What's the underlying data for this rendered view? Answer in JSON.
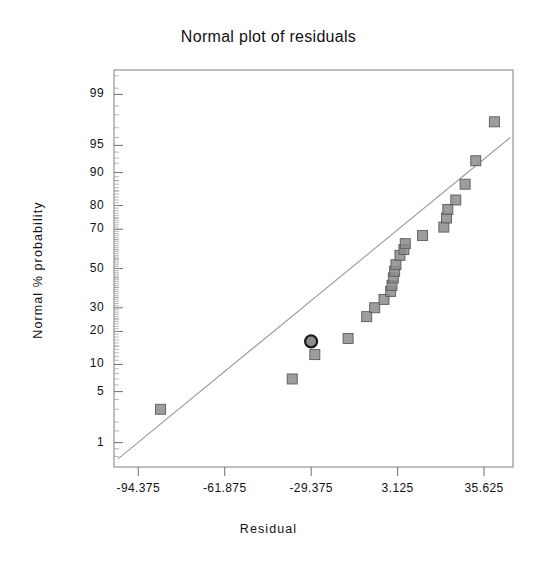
{
  "chart_data": {
    "type": "scatter",
    "title": "Normal plot of residuals",
    "xlabel": "Residual",
    "ylabel": "Normal % probability",
    "grid": false,
    "legend": "none",
    "x_tick_labels": [
      "-94.375",
      "-61.875",
      "-29.375",
      "3.125",
      "35.625"
    ],
    "x_tick_values": [
      -94.375,
      -61.875,
      -29.375,
      3.125,
      35.625
    ],
    "xlim": [
      -103.5,
      46.5
    ],
    "y_tick_labels": [
      "99",
      "95",
      "90",
      "80",
      "70",
      "50",
      "30",
      "20",
      "10",
      "5",
      "1"
    ],
    "y_tick_values": [
      99,
      95,
      90,
      80,
      70,
      50,
      30,
      20,
      10,
      5,
      1
    ],
    "ylim": [
      0.4,
      99.6
    ],
    "y_scale": "normal-probability",
    "reference_line": {
      "x_start": -102.0,
      "y_start": 0.55,
      "x_end": 45.5,
      "y_end": 96.0
    },
    "points": [
      {
        "x": -86.0,
        "y": 3.0,
        "marker": "square",
        "highlighted": false
      },
      {
        "x": -36.5,
        "y": 7.0,
        "marker": "square",
        "highlighted": false
      },
      {
        "x": -29.4,
        "y": 16.5,
        "marker": "circle",
        "highlighted": true
      },
      {
        "x": -28.0,
        "y": 12.5,
        "marker": "square",
        "highlighted": false
      },
      {
        "x": -15.5,
        "y": 17.5,
        "marker": "square",
        "highlighted": false
      },
      {
        "x": -8.5,
        "y": 26.0,
        "marker": "square",
        "highlighted": false
      },
      {
        "x": -5.5,
        "y": 30.0,
        "marker": "square",
        "highlighted": false
      },
      {
        "x": -2.0,
        "y": 34.0,
        "marker": "square",
        "highlighted": false
      },
      {
        "x": 0.5,
        "y": 38.0,
        "marker": "square",
        "highlighted": false
      },
      {
        "x": 1.0,
        "y": 41.0,
        "marker": "square",
        "highlighted": false
      },
      {
        "x": 1.5,
        "y": 45.0,
        "marker": "square",
        "highlighted": false
      },
      {
        "x": 2.0,
        "y": 48.5,
        "marker": "square",
        "highlighted": false
      },
      {
        "x": 2.5,
        "y": 52.0,
        "marker": "square",
        "highlighted": false
      },
      {
        "x": 4.0,
        "y": 57.0,
        "marker": "square",
        "highlighted": false
      },
      {
        "x": 5.5,
        "y": 60.0,
        "marker": "square",
        "highlighted": false
      },
      {
        "x": 6.0,
        "y": 63.0,
        "marker": "square",
        "highlighted": false
      },
      {
        "x": 12.5,
        "y": 67.0,
        "marker": "square",
        "highlighted": false
      },
      {
        "x": 20.5,
        "y": 71.0,
        "marker": "square",
        "highlighted": false
      },
      {
        "x": 21.5,
        "y": 75.0,
        "marker": "square",
        "highlighted": false
      },
      {
        "x": 22.0,
        "y": 78.5,
        "marker": "square",
        "highlighted": false
      },
      {
        "x": 25.0,
        "y": 82.0,
        "marker": "square",
        "highlighted": false
      },
      {
        "x": 28.5,
        "y": 87.0,
        "marker": "square",
        "highlighted": false
      },
      {
        "x": 32.5,
        "y": 92.5,
        "marker": "square",
        "highlighted": false
      },
      {
        "x": 39.5,
        "y": 97.5,
        "marker": "square",
        "highlighted": false
      }
    ],
    "marker_style": {
      "fill": "#8c8c8c",
      "edge": "#5a5a5a",
      "size_px": 10,
      "highlight_edge": "#1a1a1a"
    },
    "frame_color": "#8a8a8a",
    "line_color": "#9a9a9a"
  }
}
